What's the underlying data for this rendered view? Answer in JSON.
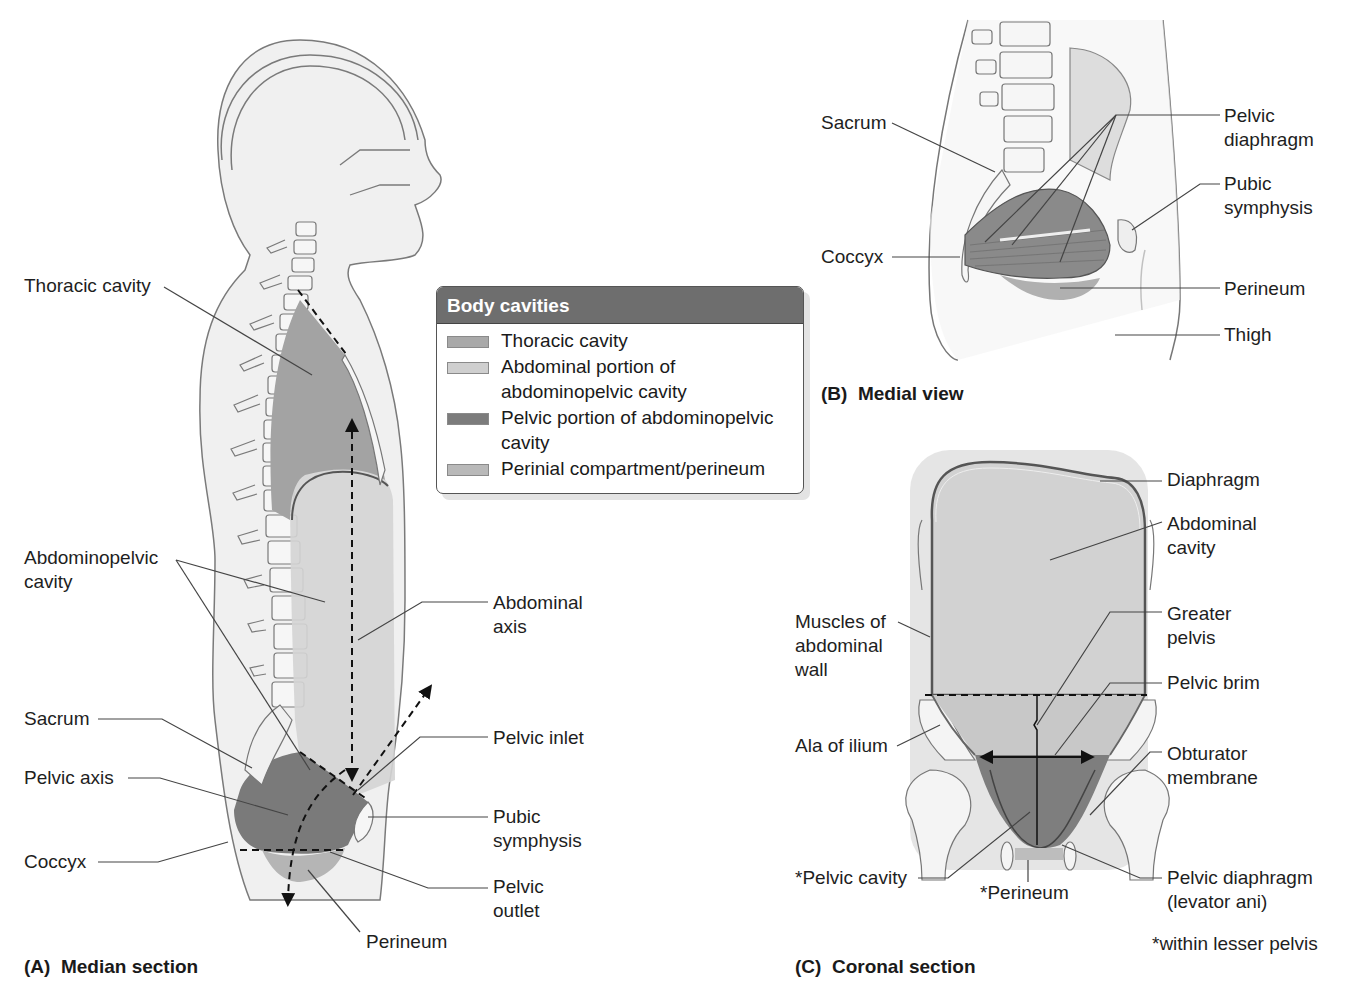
{
  "figure": {
    "panels": [
      {
        "id": "A",
        "title": "(A)  Median section",
        "labels": {
          "thoracic_cavity": "Thoracic cavity",
          "abdominopelvic_cavity": "Abdominopelvic\ncavity",
          "abdominal_axis": "Abdominal\naxis",
          "sacrum": "Sacrum",
          "pelvic_inlet": "Pelvic inlet",
          "pelvic_axis": "Pelvic axis",
          "pubic_symphysis": "Pubic\nsymphysis",
          "coccyx": "Coccyx",
          "pelvic_outlet": "Pelvic\noutlet",
          "perineum": "Perineum"
        }
      },
      {
        "id": "B",
        "title": "(B)  Medial view",
        "labels": {
          "sacrum": "Sacrum",
          "pelvic_diaphragm": "Pelvic\ndiaphragm",
          "pubic_symphysis": "Pubic\nsymphysis",
          "coccyx": "Coccyx",
          "perineum": "Perineum",
          "thigh": "Thigh"
        }
      },
      {
        "id": "C",
        "title": "(C)  Coronal section",
        "labels": {
          "diaphragm": "Diaphragm",
          "abdominal_cavity": "Abdominal\ncavity",
          "muscles_abdominal_wall": "Muscles of\nabdominal\nwall",
          "greater_pelvis": "Greater\npelvis",
          "pelvic_brim": "Pelvic brim",
          "ala_of_ilium": "Ala of ilium",
          "obturator_membrane": "Obturator\nmembrane",
          "pelvic_cavity": "*Pelvic cavity",
          "perineum": "*Perineum",
          "pelvic_diaphragm": "Pelvic diaphragm\n(levator ani)",
          "footnote": "*within lesser pelvis"
        }
      }
    ],
    "legend": {
      "title": "Body cavities",
      "items": [
        {
          "label": "Thoracic cavity",
          "color": "#a9a9a9"
        },
        {
          "label": "Abdominal portion of\nabdominopelvic cavity",
          "color": "#cfcfcf"
        },
        {
          "label": "Pelvic portion of abdominopelvic\ncavity",
          "color": "#7c7c7c"
        },
        {
          "label": "Perinial compartment/perineum",
          "color": "#b9b9b9"
        }
      ]
    },
    "colors": {
      "thoracic": "#a3a3a3",
      "abdominal": "#d2d2d2",
      "pelvic": "#7a7a7a",
      "perineum": "#b5b5b5",
      "body_fill": "#efefef",
      "outline": "#707070",
      "legend_header": "#6e6e6e"
    }
  }
}
